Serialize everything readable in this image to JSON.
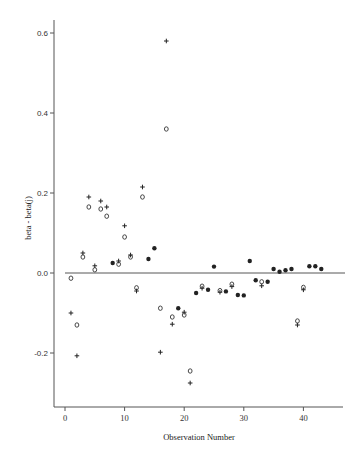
{
  "chart_data": {
    "type": "scatter",
    "title": "",
    "xlabel": "Observation Number",
    "ylabel": "beta - beta(j)",
    "xlim": [
      -2,
      47
    ],
    "ylim": [
      -0.32,
      0.63
    ],
    "xticks": [
      0,
      10,
      20,
      30,
      40
    ],
    "yticks": [
      -0.2,
      0.0,
      0.2,
      0.4,
      0.6
    ],
    "ytick_labels": [
      "-0.2",
      "0.0",
      "0.2",
      "0.4",
      "0.6"
    ],
    "xtick_labels": [
      "0",
      "10",
      "20",
      "30",
      "40"
    ],
    "reference_line": {
      "y": 0.0,
      "x_from": 0,
      "x_to": 47
    },
    "grid": false,
    "legend": null,
    "marker_legend_note": "Two series per observation: '+' and 'o'; overlapping pairs appear as filled dots",
    "series": [
      {
        "name": "plus",
        "marker": "+",
        "points": [
          [
            1,
            -0.1
          ],
          [
            2,
            -0.207
          ],
          [
            3,
            0.05
          ],
          [
            4,
            0.19
          ],
          [
            5,
            0.018
          ],
          [
            6,
            0.18
          ],
          [
            7,
            0.165
          ],
          [
            8,
            0.025
          ],
          [
            9,
            0.03
          ],
          [
            10,
            0.118
          ],
          [
            11,
            0.045
          ],
          [
            12,
            -0.045
          ],
          [
            13,
            0.215
          ],
          [
            14,
            0.035
          ],
          [
            15,
            0.062
          ],
          [
            16,
            -0.198
          ],
          [
            17,
            0.58
          ],
          [
            18,
            -0.128
          ],
          [
            19,
            -0.088
          ],
          [
            20,
            -0.098
          ],
          [
            21,
            -0.275
          ],
          [
            22,
            -0.05
          ],
          [
            23,
            -0.038
          ],
          [
            24,
            -0.042
          ],
          [
            25,
            0.016
          ],
          [
            26,
            -0.048
          ],
          [
            27,
            -0.046
          ],
          [
            28,
            -0.034
          ],
          [
            29,
            -0.055
          ],
          [
            30,
            -0.056
          ],
          [
            31,
            0.03
          ],
          [
            32,
            -0.018
          ],
          [
            33,
            -0.032
          ],
          [
            34,
            -0.022
          ],
          [
            35,
            0.01
          ],
          [
            36,
            0.003
          ],
          [
            37,
            0.007
          ],
          [
            38,
            0.01
          ],
          [
            39,
            -0.13
          ],
          [
            40,
            -0.042
          ],
          [
            41,
            0.017
          ],
          [
            42,
            0.017
          ],
          [
            43,
            0.01
          ]
        ]
      },
      {
        "name": "circle",
        "marker": "o",
        "points": [
          [
            1,
            -0.013
          ],
          [
            2,
            -0.13
          ],
          [
            3,
            0.04
          ],
          [
            4,
            0.165
          ],
          [
            5,
            0.008
          ],
          [
            6,
            0.16
          ],
          [
            7,
            0.142
          ],
          [
            8,
            0.025
          ],
          [
            9,
            0.022
          ],
          [
            10,
            0.09
          ],
          [
            11,
            0.04
          ],
          [
            12,
            -0.037
          ],
          [
            13,
            0.19
          ],
          [
            14,
            0.033
          ],
          [
            15,
            0.062
          ],
          [
            16,
            -0.088
          ],
          [
            17,
            0.36
          ],
          [
            18,
            -0.11
          ],
          [
            19,
            -0.088
          ],
          [
            20,
            -0.105
          ],
          [
            21,
            -0.245
          ],
          [
            22,
            -0.048
          ],
          [
            23,
            -0.033
          ],
          [
            24,
            -0.042
          ],
          [
            25,
            0.016
          ],
          [
            26,
            -0.044
          ],
          [
            27,
            -0.046
          ],
          [
            28,
            -0.028
          ],
          [
            29,
            -0.055
          ],
          [
            30,
            -0.056
          ],
          [
            31,
            0.03
          ],
          [
            32,
            -0.018
          ],
          [
            33,
            -0.022
          ],
          [
            34,
            -0.022
          ],
          [
            35,
            0.01
          ],
          [
            36,
            0.003
          ],
          [
            37,
            0.007
          ],
          [
            38,
            0.01
          ],
          [
            39,
            -0.12
          ],
          [
            40,
            -0.036
          ],
          [
            41,
            0.017
          ],
          [
            42,
            0.017
          ],
          [
            43,
            0.01
          ]
        ]
      }
    ]
  },
  "axes": {
    "x_title": "Observation Number",
    "y_title": "beta - beta(j)"
  }
}
